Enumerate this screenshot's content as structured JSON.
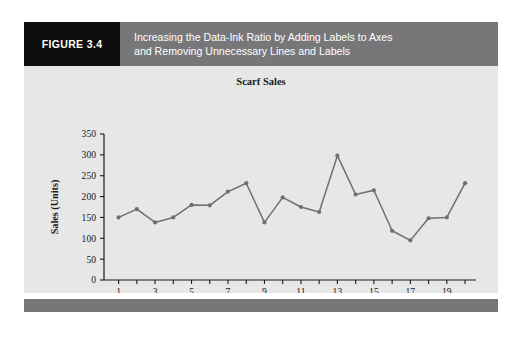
{
  "figure": {
    "number_label": "FIGURE 3.4",
    "caption": "Increasing the Data-Ink Ratio by Adding Labels to Axes\nand Removing Unnecessary Lines and Labels"
  },
  "colors": {
    "figure_number_bg": "#0d0d0d",
    "caption_bg": "#77777a",
    "panel_bg": "#e7e7e7",
    "footer_bg": "#77777a",
    "series_line": "#6f6f6f",
    "axis": "#1a1a1a",
    "text": "#1a1a1a"
  },
  "chart_data": {
    "type": "line",
    "title": "Scarf Sales",
    "xlabel": "Day",
    "ylabel": "Sales (Units)",
    "x": [
      1,
      2,
      3,
      4,
      5,
      6,
      7,
      8,
      9,
      10,
      11,
      12,
      13,
      14,
      15,
      16,
      17,
      18,
      19,
      20
    ],
    "values": [
      150,
      170,
      138,
      150,
      180,
      179,
      212,
      232,
      138,
      198,
      175,
      163,
      298,
      205,
      215,
      118,
      95,
      148,
      150,
      232
    ],
    "series": [
      {
        "name": "Scarf Sales",
        "values": [
          150,
          170,
          138,
          150,
          180,
          179,
          212,
          232,
          138,
          198,
          175,
          163,
          298,
          205,
          215,
          118,
          95,
          148,
          150,
          232
        ]
      }
    ],
    "xlim": [
      0.2,
      20.6
    ],
    "ylim": [
      0,
      350
    ],
    "ytick_labels": [
      "0",
      "50",
      "100",
      "150",
      "200",
      "250",
      "300",
      "350"
    ],
    "ytick_values": [
      0,
      50,
      100,
      150,
      200,
      250,
      300,
      350
    ],
    "xtick_values": [
      1,
      2,
      3,
      4,
      5,
      6,
      7,
      8,
      9,
      10,
      11,
      12,
      13,
      14,
      15,
      16,
      17,
      18,
      19,
      20
    ],
    "xtick_labels_shown": [
      "1",
      "3",
      "5",
      "7",
      "9",
      "11",
      "13",
      "15",
      "17",
      "19"
    ],
    "xtick_labels_shown_values": [
      1,
      3,
      5,
      7,
      9,
      11,
      13,
      15,
      17,
      19
    ],
    "grid": false,
    "legend": "none",
    "markers": true
  }
}
